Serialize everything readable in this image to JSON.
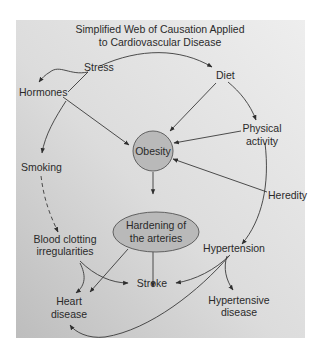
{
  "title_lines": [
    "Simplified Web of Causation Applied",
    "to Cardiovascular Disease"
  ],
  "nodes": {
    "stress": "Stress",
    "diet": "Diet",
    "hormones": "Hormones",
    "obesity": "Obesity",
    "physical_activity": [
      "Physical",
      "activity"
    ],
    "smoking": "Smoking",
    "heredity": "Heredity",
    "hardening": [
      "Hardening of",
      "the arteries"
    ],
    "blood_clotting": [
      "Blood clotting",
      "irregularities"
    ],
    "hypertension": "Hypertension",
    "stroke": "Stroke",
    "heart_disease": [
      "Heart",
      "disease"
    ],
    "hypertensive_disease": [
      "Hypertensive",
      "disease"
    ]
  },
  "edges": [
    {
      "from": "Stress",
      "to": "Diet"
    },
    {
      "from": "Stress",
      "to": "Hormones"
    },
    {
      "from": "Hormones",
      "to": "Obesity"
    },
    {
      "from": "Hormones",
      "to": "Smoking"
    },
    {
      "from": "Diet",
      "to": "Obesity"
    },
    {
      "from": "Diet",
      "to": "Physical activity"
    },
    {
      "from": "Physical activity",
      "to": "Obesity"
    },
    {
      "from": "Physical activity",
      "to": "Hypertension"
    },
    {
      "from": "Heredity",
      "to": "Obesity"
    },
    {
      "from": "Obesity",
      "to": "Hardening of the arteries"
    },
    {
      "from": "Smoking",
      "to": "Blood clotting irregularities",
      "style": "dashed"
    },
    {
      "from": "Hardening of the arteries",
      "to": "Stroke"
    },
    {
      "from": "Hardening of the arteries",
      "to": "Heart disease"
    },
    {
      "from": "Blood clotting irregularities",
      "to": "Heart disease"
    },
    {
      "from": "Blood clotting irregularities",
      "to": "Stroke"
    },
    {
      "from": "Hypertension",
      "to": "Stroke"
    },
    {
      "from": "Hypertension",
      "to": "Hypertensive disease"
    },
    {
      "from": "Hypertension",
      "to": "Heart disease"
    }
  ],
  "colors": {
    "panel_light": "#ececec",
    "panel_dark": "#c4c4c4",
    "node_fill": "#b9b9b9",
    "node_stroke": "#555555",
    "edge": "#3a3a3a",
    "text": "#2a2a2a"
  }
}
